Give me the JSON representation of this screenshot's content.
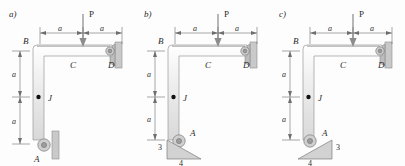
{
  "figure": {
    "type": "engineering-statics-free-body-diagram",
    "colors": {
      "bar_fill": "#eceaea",
      "bar_stroke": "#9a9a9a",
      "wall_fill": "#c9c9c9",
      "triangle_fill": "#d2d2d2",
      "pin_fill": "#cfcfcf",
      "joint_dot": "#111111",
      "text": "#2b2b2b",
      "background": "#fdfdfd"
    }
  },
  "panels": [
    {
      "id": "a",
      "label": "a)",
      "load_label": "P",
      "points": {
        "B": "B",
        "C": "C",
        "D": "D",
        "J": "J",
        "A": "A"
      },
      "dimensions": {
        "top_left": "a",
        "top_right": "a",
        "left_upper": "a",
        "left_lower": "a"
      },
      "support_at_A": "vertical-wall-roller-pin",
      "support_at_D": "pinned-to-vertical-wall",
      "slope_triangle": null
    },
    {
      "id": "b",
      "label": "b)",
      "load_label": "P",
      "points": {
        "B": "B",
        "C": "C",
        "D": "D",
        "J": "J",
        "A": "A"
      },
      "dimensions": {
        "top_left": "a",
        "top_right": "a",
        "left_upper": "a",
        "left_lower": "a"
      },
      "support_at_A": "inclined-surface-roller",
      "support_at_D": "pinned-to-vertical-wall",
      "slope_triangle": {
        "rise_label": "3",
        "run_label": "4",
        "orientation": "right-angle-top-left"
      }
    },
    {
      "id": "c",
      "label": "c)",
      "load_label": "P",
      "points": {
        "B": "B",
        "C": "C",
        "D": "D",
        "J": "J",
        "A": "A"
      },
      "dimensions": {
        "top_left": "a",
        "top_right": "a",
        "left_upper": "a",
        "left_lower": "a"
      },
      "support_at_A": "inclined-surface-roller-mirrored",
      "support_at_D": "pinned-to-vertical-wall",
      "slope_triangle": {
        "rise_label": "3",
        "run_label": "4",
        "orientation": "right-angle-top-right"
      }
    }
  ]
}
